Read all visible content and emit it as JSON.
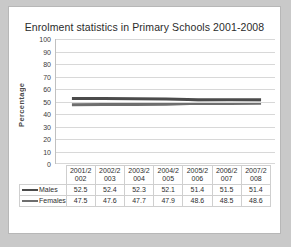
{
  "chart_data": {
    "type": "line",
    "title": "Enrolment statistics in Primary Schools 2001-2008",
    "xlabel": "",
    "ylabel": "Percentage",
    "ylim": [
      0,
      100
    ],
    "ytick_step": 10,
    "yticks": [
      100,
      90,
      80,
      70,
      60,
      50,
      40,
      30,
      20,
      10,
      0
    ],
    "grid": true,
    "legend_position": "table-left",
    "categories": [
      "2001/2002",
      "2002/2003",
      "2003/2004",
      "2004/2005",
      "2005/2006",
      "2006/2007",
      "2007/2008"
    ],
    "category_lines": [
      [
        "2001/2",
        "002"
      ],
      [
        "2002/2",
        "003"
      ],
      [
        "2003/2",
        "004"
      ],
      [
        "2004/2",
        "005"
      ],
      [
        "2005/2",
        "006"
      ],
      [
        "2006/2",
        "007"
      ],
      [
        "2007/2",
        "008"
      ]
    ],
    "series": [
      {
        "name": "Males",
        "color": "#4b4b4b",
        "values": [
          52.5,
          52.4,
          52.3,
          52.1,
          51.4,
          51.5,
          51.4
        ]
      },
      {
        "name": "Females",
        "color": "#6e6e6e",
        "values": [
          47.5,
          47.6,
          47.7,
          47.9,
          48.6,
          48.5,
          48.6
        ]
      }
    ]
  },
  "colors": {
    "page_background": "#c9c9c9",
    "card_background": "#ffffff",
    "card_border": "#b7b7b7",
    "gridline": "#d8d8d8",
    "table_border": "#cfcfcf",
    "males_line": "#4b4b4b",
    "females_line": "#6e6e6e",
    "text": "#2b2b2b"
  }
}
